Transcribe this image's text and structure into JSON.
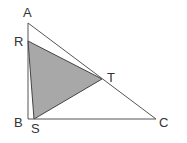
{
  "diagram": {
    "type": "geometry-triangle",
    "colors": {
      "background": "#ffffff",
      "stroke": "#555555",
      "shade": "#a8a8a8",
      "label": "#333333"
    },
    "points": {
      "A": {
        "label": "A",
        "x": 28,
        "y": 23
      },
      "R": {
        "label": "R",
        "x": 28,
        "y": 41
      },
      "T": {
        "label": "T",
        "x": 102,
        "y": 79
      },
      "B": {
        "label": "B",
        "x": 28,
        "y": 119
      },
      "S": {
        "label": "S",
        "x": 34,
        "y": 119
      },
      "C": {
        "label": "C",
        "x": 156,
        "y": 119
      }
    },
    "outer_triangle": [
      "A",
      "B",
      "C"
    ],
    "shaded_triangle": [
      "R",
      "S",
      "T"
    ]
  }
}
